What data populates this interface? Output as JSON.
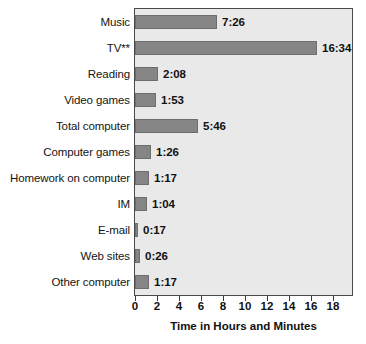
{
  "chart_data": {
    "type": "bar",
    "orientation": "horizontal",
    "title": "",
    "xlabel": "Time in Hours and Minutes",
    "ylabel": "",
    "xlim": [
      0,
      19.9
    ],
    "xticks": [
      0,
      2,
      4,
      6,
      8,
      10,
      12,
      14,
      16,
      18
    ],
    "grid": false,
    "legend": null,
    "categories": [
      "Music",
      "TV**",
      "Reading",
      "Video games",
      "Total computer",
      "Computer games",
      "Homework on computer",
      "IM",
      "E-mail",
      "Web sites",
      "Other computer"
    ],
    "value_labels": [
      "7:26",
      "16:34",
      "2:08",
      "1:53",
      "5:46",
      "1:26",
      "1:17",
      "1:04",
      "0:17",
      "0:26",
      "1:17"
    ],
    "values": [
      7.433,
      16.567,
      2.133,
      1.883,
      5.767,
      1.433,
      1.283,
      1.067,
      0.283,
      0.433,
      1.283
    ]
  },
  "colors": {
    "bar_fill": "#858585",
    "bar_stroke": "#6d6d6d",
    "plot_background": "#e9e9e9",
    "plot_border": "#4a4a4a",
    "page_background": "#ffffff",
    "text": "#111111"
  }
}
